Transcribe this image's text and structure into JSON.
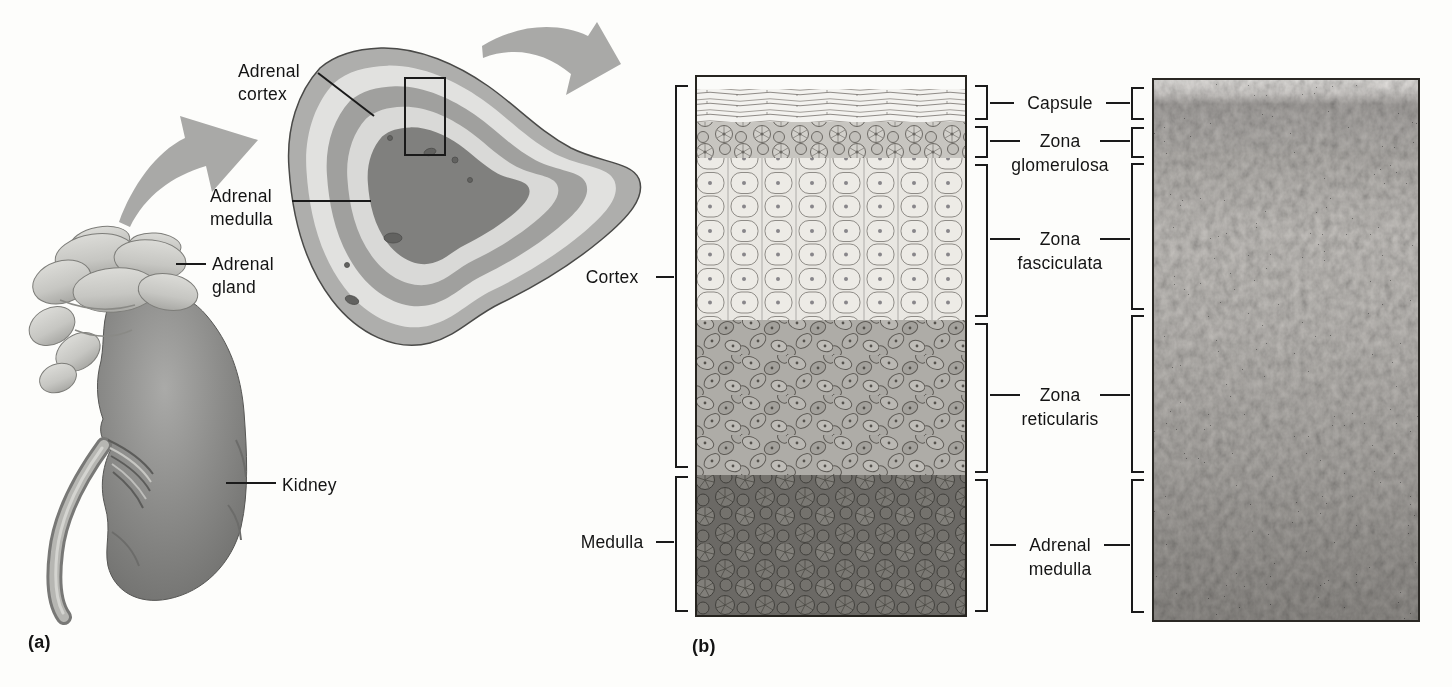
{
  "panel_a": {
    "tag": "(a)",
    "labels": {
      "adrenal_cortex": {
        "line1": "Adrenal",
        "line2": "cortex"
      },
      "adrenal_medulla": {
        "line1": "Adrenal",
        "line2": "medulla"
      },
      "adrenal_gland": {
        "line1": "Adrenal",
        "line2": "gland"
      },
      "kidney": "Kidney"
    }
  },
  "panel_b": {
    "tag": "(b)",
    "region_labels": {
      "cortex": "Cortex",
      "medulla": "Medulla"
    },
    "zone_labels": {
      "capsule": {
        "line1": "Capsule"
      },
      "zona_glomerulosa": {
        "line1": "Zona",
        "line2": "glomerulosa"
      },
      "zona_fasciculata": {
        "line1": "Zona",
        "line2": "fasciculata"
      },
      "zona_reticularis": {
        "line1": "Zona",
        "line2": "reticularis"
      },
      "adrenal_medulla": {
        "line1": "Adrenal",
        "line2": "medulla"
      }
    }
  },
  "colors": {
    "background": "#fdfdfb",
    "text": "#141414",
    "line": "#1a1a1a",
    "arrow_gray": "#a9a9a7",
    "kidney_gray": "#8c8c8a",
    "gland_light_gray": "#cccdc8",
    "medulla_dark": "#80807e"
  }
}
